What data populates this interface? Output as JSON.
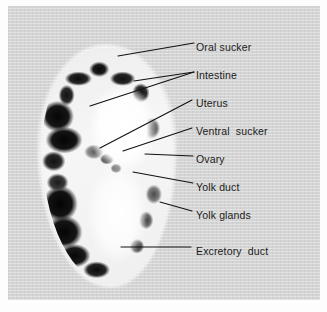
{
  "figure": {
    "kind": "labelled-micrograph",
    "background_color": "#d4d4d4",
    "mount_color": "#fdfdfd",
    "text_color": "#1b1b1b",
    "leader_color": "#111111"
  },
  "labels": [
    {
      "id": "oral-sucker",
      "text": "Oral sucker",
      "x": 196,
      "y": 41,
      "leader": [
        [
          194,
          43
        ],
        [
          118,
          56
        ]
      ]
    },
    {
      "id": "intestine",
      "text": "Intestine",
      "x": 196,
      "y": 69,
      "leader": [
        [
          194,
          72
        ],
        [
          134,
          81
        ]
      ]
    },
    {
      "id": "intestine-2",
      "text": "",
      "x": 0,
      "y": 0,
      "leader": [
        [
          194,
          72
        ],
        [
          90,
          106
        ]
      ]
    },
    {
      "id": "uterus",
      "text": "Uterus",
      "x": 196,
      "y": 97,
      "leader": [
        [
          192,
          100
        ],
        [
          100,
          148
        ]
      ]
    },
    {
      "id": "ventral-sucker",
      "text": "Ventral  sucker",
      "x": 196,
      "y": 125,
      "leader": [
        [
          192,
          128
        ],
        [
          123,
          151
        ]
      ]
    },
    {
      "id": "ovary",
      "text": "Ovary",
      "x": 196,
      "y": 153,
      "leader": [
        [
          193,
          156
        ],
        [
          145,
          154
        ]
      ]
    },
    {
      "id": "yolk-duct",
      "text": "Yolk duct",
      "x": 196,
      "y": 181,
      "leader": [
        [
          193,
          183
        ],
        [
          133,
          172
        ]
      ]
    },
    {
      "id": "yolk-glands",
      "text": "Yolk glands",
      "x": 196,
      "y": 209,
      "leader": [
        [
          192,
          211
        ],
        [
          160,
          202
        ]
      ]
    },
    {
      "id": "excretory-duct",
      "text": "Excretory  duct",
      "x": 196,
      "y": 245,
      "leader": [
        [
          191,
          247
        ],
        [
          121,
          247
        ]
      ]
    }
  ]
}
